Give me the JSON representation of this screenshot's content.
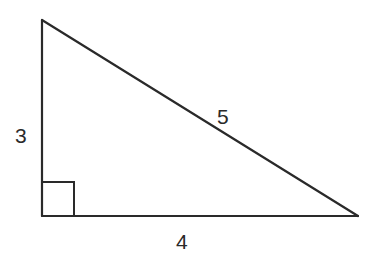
{
  "diagram": {
    "type": "right-triangle",
    "stroke_color": "#2a2a2a",
    "vertices": {
      "top": [
        42,
        20
      ],
      "right_angle": [
        42,
        216
      ],
      "right": [
        358,
        216
      ]
    },
    "right_angle_marker": {
      "x": 42,
      "y": 182,
      "size": 32
    },
    "labels": {
      "vertical_leg": "3",
      "horizontal_leg": "4",
      "hypotenuse": "5"
    }
  }
}
